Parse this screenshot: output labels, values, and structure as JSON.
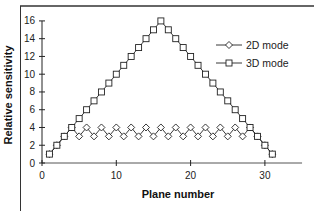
{
  "chart_data": {
    "type": "line",
    "title": "",
    "xlabel": "Plane number",
    "ylabel": "Relative sensitivity",
    "xlim": [
      0,
      35
    ],
    "ylim": [
      0,
      16
    ],
    "xticks": [
      0,
      10,
      20,
      30
    ],
    "yticks": [
      0,
      2,
      4,
      6,
      8,
      10,
      12,
      14,
      16
    ],
    "grid": false,
    "legend_position": "upper right",
    "x": [
      1,
      2,
      3,
      4,
      5,
      6,
      7,
      8,
      9,
      10,
      11,
      12,
      13,
      14,
      15,
      16,
      17,
      18,
      19,
      20,
      21,
      22,
      23,
      24,
      25,
      26,
      27,
      28,
      29,
      30,
      31
    ],
    "series": [
      {
        "name": "2D mode",
        "marker": "diamond",
        "values": [
          1,
          2,
          3,
          4,
          3,
          4,
          3,
          4,
          3,
          4,
          3,
          4,
          3,
          4,
          3,
          4,
          3,
          4,
          3,
          4,
          3,
          4,
          3,
          4,
          3,
          4,
          3,
          4,
          3,
          2,
          1
        ]
      },
      {
        "name": "3D mode",
        "marker": "square",
        "values": [
          1,
          2,
          3,
          4,
          5,
          6,
          7,
          8,
          9,
          10,
          11,
          12,
          13,
          14,
          15,
          16,
          15,
          14,
          13,
          12,
          11,
          10,
          9,
          8,
          7,
          6,
          5,
          4,
          3,
          2,
          1
        ]
      }
    ]
  }
}
